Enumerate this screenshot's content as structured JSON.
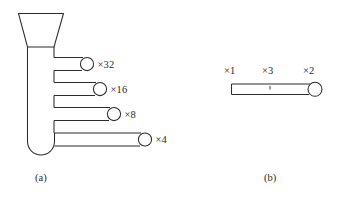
{
  "figure": {
    "background_color": "#ffffff",
    "stroke_color": "#2b2b2b",
    "panels": [
      {
        "id": "panel-a",
        "caption": "(a)",
        "description": "funnel-fed reservoir with four branch channels",
        "branches": [
          {
            "label": "×32",
            "value": 32
          },
          {
            "label": "×16",
            "value": 16
          },
          {
            "label": "×8",
            "value": 8
          },
          {
            "label": "×4",
            "value": 4
          }
        ]
      },
      {
        "id": "panel-b",
        "caption": "(b)",
        "description": "single straight channel with terminal bulb",
        "labels": [
          {
            "label": "×1",
            "value": 1,
            "position": "left"
          },
          {
            "label": "×3",
            "value": 3,
            "position": "center"
          },
          {
            "label": "×2",
            "value": 2,
            "position": "right"
          }
        ]
      }
    ]
  },
  "panel_a": {
    "caption": "(a)",
    "branch_1_label": "×32",
    "branch_2_label": "×16",
    "branch_3_label": "×8",
    "branch_4_label": "×4"
  },
  "panel_b": {
    "caption": "(b)",
    "label_left": "×1",
    "label_center": "×3",
    "label_right": "×2"
  }
}
